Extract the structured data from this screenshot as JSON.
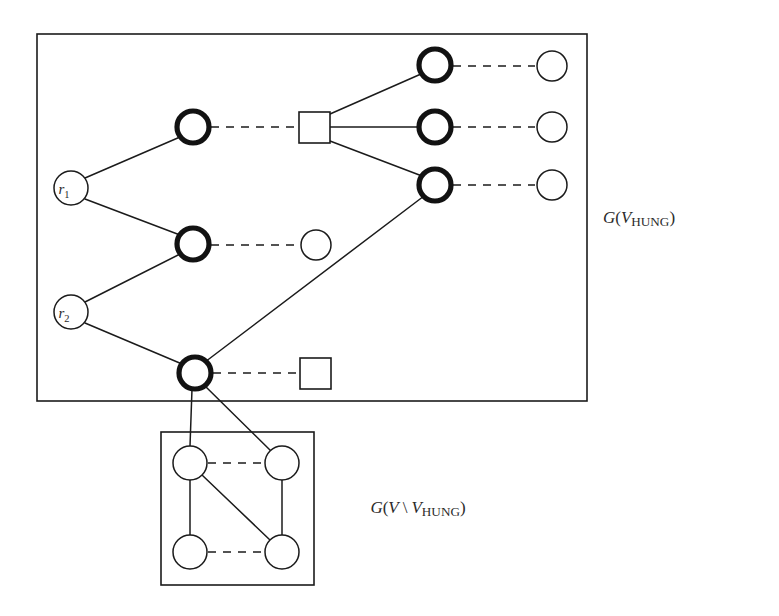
{
  "figure": {
    "stroke_color": "#1b1b1b",
    "background_color": "#ffffff",
    "labels": {
      "outer_box": {
        "full": "G(V_HUNG)",
        "g": "G",
        "open_paren": "(",
        "v": "V",
        "hung": "HUNG",
        "close_paren": ")"
      },
      "inner_box": {
        "full": "G(V \\ V_HUNG)",
        "g": "G",
        "open_paren": "(",
        "v": "V",
        "backslash": "\\",
        "v2": "V",
        "hung": "HUNG",
        "close_paren": ")"
      }
    },
    "roots": [
      {
        "id": "r1",
        "letter": "r",
        "index": "1",
        "cx": 71,
        "cy": 188,
        "r": 17
      },
      {
        "id": "r2",
        "letter": "r",
        "index": "2",
        "cx": 71,
        "cy": 312,
        "r": 17
      }
    ],
    "boxes": [
      {
        "id": "outer-box",
        "x": 37,
        "y": 34,
        "width": 550,
        "height": 367
      },
      {
        "id": "inner-box",
        "x": 161,
        "y": 432,
        "width": 153,
        "height": 153
      }
    ],
    "nodes": [
      {
        "id": "b1",
        "kind": "bold-circle",
        "cx": 193,
        "cy": 127,
        "r": 16
      },
      {
        "id": "b2",
        "kind": "bold-circle",
        "cx": 193,
        "cy": 244,
        "r": 16
      },
      {
        "id": "b3",
        "kind": "bold-circle",
        "cx": 195,
        "cy": 373,
        "r": 16
      },
      {
        "id": "b4",
        "kind": "bold-circle",
        "cx": 435,
        "cy": 65,
        "r": 16
      },
      {
        "id": "b5",
        "kind": "bold-circle",
        "cx": 435,
        "cy": 127,
        "r": 16
      },
      {
        "id": "b6",
        "kind": "bold-circle",
        "cx": 435,
        "cy": 185,
        "r": 16
      },
      {
        "id": "t1",
        "kind": "thin-circle",
        "cx": 552,
        "cy": 66,
        "r": 15
      },
      {
        "id": "t2",
        "kind": "thin-circle",
        "cx": 552,
        "cy": 127,
        "r": 15
      },
      {
        "id": "t3",
        "kind": "thin-circle",
        "cx": 552,
        "cy": 185,
        "r": 15
      },
      {
        "id": "t4",
        "kind": "thin-circle",
        "cx": 316,
        "cy": 245,
        "r": 15
      },
      {
        "id": "s1",
        "kind": "square",
        "x": 299,
        "y": 112,
        "size": 31
      },
      {
        "id": "s2",
        "kind": "square",
        "x": 300,
        "y": 358,
        "size": 31
      },
      {
        "id": "i1",
        "kind": "thin-circle",
        "cx": 190,
        "cy": 463,
        "r": 17
      },
      {
        "id": "i2",
        "kind": "thin-circle",
        "cx": 282,
        "cy": 463,
        "r": 17
      },
      {
        "id": "i3",
        "kind": "thin-circle",
        "cx": 190,
        "cy": 552,
        "r": 17
      },
      {
        "id": "i4",
        "kind": "thin-circle",
        "cx": 282,
        "cy": 552,
        "r": 17
      }
    ],
    "edges_solid": [
      {
        "from": "r1",
        "to": "b1",
        "x1": 85,
        "y1": 178,
        "x2": 180,
        "y2": 137
      },
      {
        "from": "r1",
        "to": "b2",
        "x1": 85,
        "y1": 199,
        "x2": 180,
        "y2": 235
      },
      {
        "from": "r2",
        "to": "b2",
        "x1": 85,
        "y1": 302,
        "x2": 180,
        "y2": 254
      },
      {
        "from": "r2",
        "to": "b3",
        "x1": 85,
        "y1": 323,
        "x2": 182,
        "y2": 364
      },
      {
        "from": "s1",
        "to": "b4",
        "x1": 330,
        "y1": 114,
        "x2": 421,
        "y2": 74
      },
      {
        "from": "s1",
        "to": "b5",
        "x1": 330,
        "y1": 127,
        "x2": 419,
        "y2": 127
      },
      {
        "from": "s1",
        "to": "b6",
        "x1": 330,
        "y1": 141,
        "x2": 422,
        "y2": 176
      },
      {
        "from": "b6",
        "to": "b3",
        "x1": 424,
        "y1": 196,
        "x2": 205,
        "y2": 362
      },
      {
        "from": "b3",
        "to": "i1",
        "x1": 192,
        "y1": 389,
        "x2": 190,
        "y2": 446
      },
      {
        "from": "b3",
        "to": "i2",
        "x1": 205,
        "y1": 386,
        "x2": 271,
        "y2": 451
      },
      {
        "from": "i1",
        "to": "i3",
        "x1": 190,
        "y1": 480,
        "x2": 190,
        "y2": 535
      },
      {
        "from": "i1",
        "to": "i4",
        "x1": 202,
        "y1": 475,
        "x2": 270,
        "y2": 540
      },
      {
        "from": "i2",
        "to": "i4",
        "x1": 282,
        "y1": 480,
        "x2": 282,
        "y2": 535
      }
    ],
    "edges_dashed": [
      {
        "from": "b1",
        "to": "s1",
        "x1": 211,
        "y1": 127,
        "x2": 297,
        "y2": 127
      },
      {
        "from": "b4",
        "to": "t1",
        "x1": 453,
        "y1": 66,
        "x2": 535,
        "y2": 66
      },
      {
        "from": "b5",
        "to": "t2",
        "x1": 453,
        "y1": 127,
        "x2": 535,
        "y2": 127
      },
      {
        "from": "b6",
        "to": "t3",
        "x1": 453,
        "y1": 185,
        "x2": 535,
        "y2": 185
      },
      {
        "from": "b2",
        "to": "t4",
        "x1": 211,
        "y1": 245,
        "x2": 299,
        "y2": 245
      },
      {
        "from": "b3",
        "to": "s2",
        "x1": 213,
        "y1": 373,
        "x2": 298,
        "y2": 373
      },
      {
        "from": "i1",
        "to": "i2",
        "x1": 208,
        "y1": 463,
        "x2": 264,
        "y2": 463
      },
      {
        "from": "i3",
        "to": "i4",
        "x1": 208,
        "y1": 552,
        "x2": 264,
        "y2": 552
      }
    ]
  }
}
